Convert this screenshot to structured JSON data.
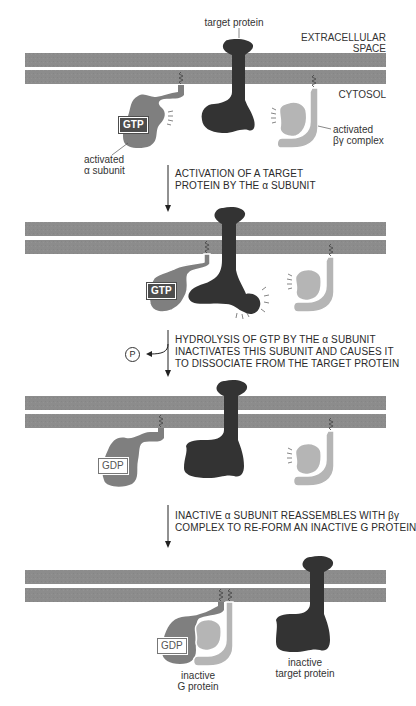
{
  "colors": {
    "membrane": "#8c8c8c",
    "target_protein": "#333333",
    "alpha_subunit": "#7f7f7f",
    "beta_gamma": "#b5b5b5",
    "gtp_badge": "#4d4d4d"
  },
  "labels": {
    "target_protein": "target protein",
    "extracellular_line1": "EXTRACELLULAR",
    "extracellular_line2": "SPACE",
    "cytosol": "CYTOSOL",
    "activated_alpha_line1": "activated",
    "activated_alpha_line2": "α subunit",
    "activated_bg_line1": "activated",
    "activated_bg_line2": "βγ complex",
    "inactive_g_line1": "inactive",
    "inactive_g_line2": "G protein",
    "inactive_target_line1": "inactive",
    "inactive_target_line2": "target protein"
  },
  "badges": {
    "gtp": "GTP",
    "gdp": "GDP",
    "phosphate": "P"
  },
  "steps": [
    {
      "line1": "ACTIVATION OF A TARGET",
      "line2": "PROTEIN BY THE α SUBUNIT"
    },
    {
      "line1": "HYDROLYSIS OF GTP BY THE α SUBUNIT",
      "line2": "INACTIVATES THIS SUBUNIT AND CAUSES IT",
      "line3": "TO DISSOCIATE FROM THE TARGET PROTEIN"
    },
    {
      "line1": "INACTIVE α SUBUNIT REASSEMBLES WITH βγ",
      "line2": "COMPLEX TO RE-FORM AN INACTIVE G PROTEIN"
    }
  ],
  "panels": [
    {
      "name": "activated state",
      "membrane_top": 53
    },
    {
      "name": "target activation",
      "membrane_top": 222
    },
    {
      "name": "gtp hydrolysis",
      "membrane_top": 396
    },
    {
      "name": "reassembly",
      "membrane_top": 570
    }
  ]
}
